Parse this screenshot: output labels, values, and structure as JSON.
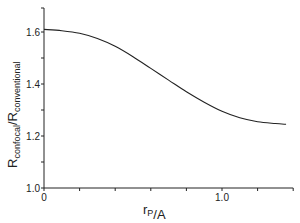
{
  "chart_data": {
    "type": "line",
    "title": "",
    "xlabel": "r_P/A",
    "xlabel_main": "r",
    "xlabel_sub": "P",
    "xlabel_rest": "/A",
    "ylabel": "R_confocal/R_conventional",
    "ylabel_main1": "R",
    "ylabel_sub1": "confocal",
    "ylabel_slash": "/",
    "ylabel_main2": "R",
    "ylabel_sub2": "conventional",
    "xlim": [
      0,
      1.4
    ],
    "ylim": [
      1.0,
      1.7
    ],
    "grid": false,
    "legend": null,
    "x_ticks": [
      0,
      0.2,
      0.4,
      0.6,
      0.8,
      1.0,
      1.2,
      1.4
    ],
    "x_tick_labels": {
      "0": "0",
      "1.0": "1.0"
    },
    "y_ticks": [
      1.0,
      1.1,
      1.2,
      1.3,
      1.4,
      1.5,
      1.6
    ],
    "y_tick_labels": [
      "1.0",
      "1.2",
      "1.4",
      "1.6"
    ],
    "series": [
      {
        "name": "R_confocal/R_conventional",
        "x": [
          0.0,
          0.1,
          0.2,
          0.3,
          0.4,
          0.5,
          0.6,
          0.7,
          0.8,
          0.9,
          1.0,
          1.1,
          1.2,
          1.3,
          1.36
        ],
        "y": [
          1.61,
          1.605,
          1.595,
          1.575,
          1.545,
          1.505,
          1.46,
          1.415,
          1.37,
          1.33,
          1.295,
          1.27,
          1.255,
          1.248,
          1.245
        ]
      }
    ]
  }
}
